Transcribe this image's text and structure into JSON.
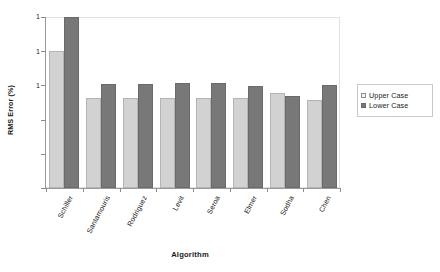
{
  "chart_data": {
    "type": "bar",
    "title": "",
    "xlabel": "Algorithm",
    "ylabel": "RMS Error (%)",
    "yscale": "log",
    "ylim": [
      0.001,
      100
    ],
    "ytick_labels": [
      "1",
      "1",
      "1"
    ],
    "grid": false,
    "legend_position": "right",
    "categories": [
      "Schiller",
      "Santamouris",
      "Rodriguez",
      "Levit",
      "Seroa",
      "Elmer",
      "Sodha",
      "Chen"
    ],
    "series": [
      {
        "name": "Upper Case",
        "color": "#d2d2d2",
        "values": [
          10.0,
          0.42,
          0.42,
          0.43,
          0.43,
          0.44,
          0.6,
          0.38
        ]
      },
      {
        "name": "Lower Case",
        "color": "#787878",
        "values": [
          100.0,
          1.1,
          1.12,
          1.15,
          1.15,
          0.98,
          0.5,
          1.05
        ]
      }
    ]
  },
  "axes": {
    "y_title": "RMS Error (%)",
    "x_title": "Algorithm"
  },
  "legend": {
    "items": [
      {
        "label": "Upper Case"
      },
      {
        "label": "Lower Case"
      }
    ]
  },
  "colors": {
    "upper_case": "#d2d2d2",
    "lower_case": "#787878",
    "axis": "#8c8c8c",
    "frame": "#e2e2e2",
    "text": "#1a1a1a",
    "background": "#ffffff"
  }
}
